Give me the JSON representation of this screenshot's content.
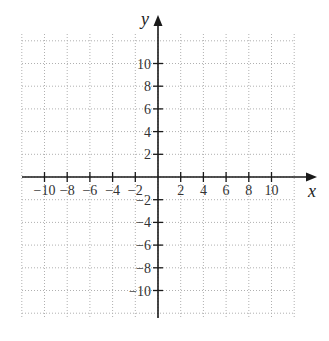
{
  "chart_data": {
    "type": "scatter",
    "title": "",
    "xlabel": "x",
    "ylabel": "y",
    "xlim": [
      -12,
      12
    ],
    "ylim": [
      -12,
      12
    ],
    "grid": true,
    "grid_style": "dotted",
    "grid_step": 2,
    "x_ticks": [
      -10,
      -8,
      -6,
      -4,
      -2,
      2,
      4,
      6,
      8,
      10
    ],
    "y_ticks": [
      10,
      8,
      6,
      4,
      2,
      -2,
      -4,
      -6,
      -8,
      -10
    ],
    "x_tick_labels": [
      "−10",
      "−8",
      "−6",
      "−4",
      "−2",
      "2",
      "4",
      "6",
      "8",
      "10"
    ],
    "y_tick_labels": [
      "10",
      "8",
      "6",
      "4",
      "2",
      "−2",
      "−4",
      "−6",
      "−8",
      "−10"
    ],
    "series": [],
    "legend": null
  },
  "colors": {
    "axis": "#1a1a1a",
    "grid": "#b0b0b0",
    "text": "#333333",
    "background": "#ffffff"
  },
  "layout": {
    "origin_px": [
      158,
      177
    ],
    "unit_px": 11.35,
    "grid_left_px": 22,
    "grid_right_px": 294,
    "grid_top_px": 34,
    "grid_bottom_px": 318
  }
}
